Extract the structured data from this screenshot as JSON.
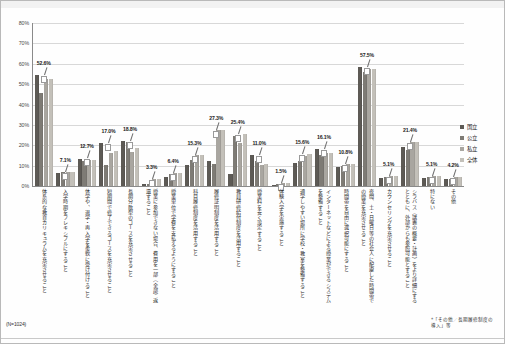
{
  "chart_data": {
    "type": "bar",
    "title": "",
    "xlabel": "",
    "ylabel": "",
    "ylim": [
      0,
      80
    ],
    "ytick_labels": [
      "80%",
      "70%",
      "60%",
      "50%",
      "40%",
      "30%",
      "20%",
      "10%",
      "0%"
    ],
    "ytick_values": [
      80,
      70,
      60,
      50,
      40,
      30,
      20,
      10,
      0
    ],
    "grid": true,
    "legend_position": "right",
    "categories": [
      "体系的な教育カリキュラムを充実させること",
      "入学時期をフレキシブルにすること",
      "休学や、退学・再入学を柔軟に受け付けること",
      "短期間で修了できるコースを充実させること",
      "長期分散型のコースを充実させること",
      "授業に参加できない場合、費用を一部（全部）返還すること",
      "授業単位で学費を支払えるようにすること",
      "科目履修制度を活用すること",
      "履修証明制度を活用すること",
      "教員研修給付制度を活用すること",
      "授業料を安く設定すること",
      "体験入学を実施すること",
      "通学しやすい場所に学校・教室を整備すること",
      "インターネットなどによる授業ができるシステムを整備すること",
      "時間帯を自由に選択可能にすること",
      "夜間、土・日曜日等の社会人に配慮した時間帯での授業を充実させること",
      "カウンセリングを充実させること",
      "シラバス（講義の概要・計画）をより詳細にするとともに、外部からも参照可能とすること",
      "特にない",
      "その他"
    ],
    "series": [
      {
        "name": "国立",
        "color": "#5d5a55",
        "values": [
          54.5,
          6.2,
          13.5,
          21.0,
          22.0,
          0.8,
          4.2,
          10.5,
          12.5,
          6.0,
          15.0,
          0.6,
          11.5,
          18.0,
          9.5,
          58.5,
          4.0,
          19.0,
          4.0,
          3.2
        ]
      },
      {
        "name": "公立",
        "color": "#7e7b75",
        "values": [
          45.8,
          6.8,
          12.2,
          10.5,
          21.5,
          1.0,
          5.8,
          13.0,
          11.0,
          24.5,
          12.5,
          1.2,
          12.5,
          15.0,
          10.0,
          56.0,
          4.5,
          17.5,
          4.5,
          3.6
        ]
      },
      {
        "name": "私立",
        "color": "#a9a6a0",
        "values": [
          52.6,
          7.1,
          13.0,
          16.0,
          16.5,
          3.3,
          6.4,
          15.3,
          27.3,
          21.0,
          10.5,
          1.5,
          14.5,
          16.1,
          10.8,
          57.5,
          5.1,
          21.4,
          5.1,
          4.2
        ]
      },
      {
        "name": "全体",
        "color": "#c3c0b9",
        "values": [
          52.6,
          7.1,
          12.7,
          17.0,
          18.8,
          3.3,
          6.4,
          15.3,
          27.3,
          25.4,
          11.0,
          1.5,
          15.6,
          16.1,
          10.8,
          57.5,
          5.1,
          21.4,
          5.1,
          4.2
        ]
      }
    ],
    "data_labels": [
      "52.6%",
      "7.1%",
      "12.7%",
      "17.0%",
      "18.8%",
      "3.3%",
      "6.4%",
      "15.3%",
      "27.3%",
      "25.4%",
      "11.0%",
      "1.5%",
      "15.6%",
      "16.1%",
      "10.8%",
      "57.5%",
      "5.1%",
      "21.4%",
      "5.1%",
      "4.2%"
    ]
  },
  "legend": {
    "items": [
      {
        "label": "国立"
      },
      {
        "label": "公立"
      },
      {
        "label": "私立"
      },
      {
        "label": "全体"
      }
    ]
  },
  "notes": {
    "sample_size": "(N=1024)",
    "footnote": "*「その他／長期履修制度の導入」等"
  }
}
